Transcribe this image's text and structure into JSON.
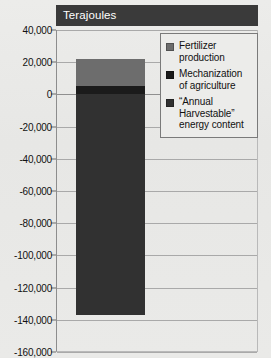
{
  "title": "Terajoules",
  "chart_data": {
    "type": "bar",
    "title": "Terajoules",
    "xlabel": "",
    "ylabel": "Terajoules",
    "ylim": [
      -160000,
      40000
    ],
    "grid": true,
    "legend_position": "top-right",
    "stacked": true,
    "categories": [
      ""
    ],
    "yticks": [
      "40,000",
      "20,000",
      "0",
      "-20,000",
      "-40,000",
      "-60,000",
      "-80,000",
      "-100,000",
      "-120,000",
      "-140,000",
      "-160,000"
    ],
    "ytick_values": [
      40000,
      20000,
      0,
      -20000,
      -40000,
      -60000,
      -80000,
      -100000,
      -120000,
      -140000,
      -160000
    ],
    "series": [
      {
        "name": "Fertilizer production",
        "color": "#6d6d6d",
        "values": [
          17000
        ],
        "range": [
          5000,
          22000
        ]
      },
      {
        "name": "Mechanization of agriculture",
        "color": "#1b1b1b",
        "values": [
          5000
        ],
        "range": [
          0,
          5000
        ]
      },
      {
        "name": "“Annual Harvestable” energy content",
        "color": "#313131",
        "values": [
          -137000
        ],
        "range": [
          -137000,
          0
        ]
      }
    ]
  },
  "legend": {
    "items": [
      {
        "label": "Fertilizer production",
        "color": "#6d6d6d"
      },
      {
        "label": "Mechanization of agriculture",
        "color": "#1b1b1b"
      },
      {
        "label": "“Annual Harvestable” energy content",
        "color": "#313131"
      }
    ]
  },
  "colors": {
    "title_bar_bg": "#3a3a3a",
    "title_text": "#ffffff",
    "background": "#e9e9e7",
    "gridline": "#a9a9a9",
    "axis": "#8d8d8d"
  }
}
